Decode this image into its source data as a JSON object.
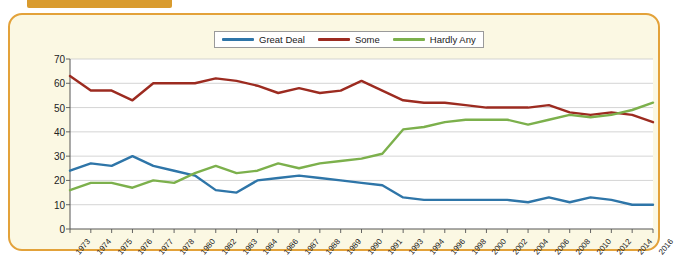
{
  "header": {
    "tab_label": "",
    "caption": ""
  },
  "panel": {
    "background_color": "#fbf8e3",
    "border_color": "#e3a23a"
  },
  "chart_data": {
    "type": "line",
    "title": "",
    "xlabel": "",
    "ylabel": "Percent",
    "ylim": [
      0,
      70
    ],
    "yticks": [
      0,
      10,
      20,
      30,
      40,
      50,
      60,
      70
    ],
    "grid": true,
    "legend_position": "top-center",
    "plot_background": "#ffffff",
    "categories": [
      "1973",
      "1974",
      "1975",
      "1976",
      "1977",
      "1978",
      "1980",
      "1982",
      "1983",
      "1984",
      "1986",
      "1987",
      "1988",
      "1989",
      "1990",
      "1991",
      "1993",
      "1994",
      "1996",
      "1998",
      "2000",
      "2002",
      "2004",
      "2006",
      "2008",
      "2010",
      "2012",
      "2014",
      "2016"
    ],
    "series": [
      {
        "name": "Great Deal",
        "color": "#2e75a8",
        "values": [
          24,
          27,
          26,
          30,
          26,
          24,
          22,
          16,
          15,
          20,
          21,
          22,
          21,
          20,
          19,
          18,
          13,
          12,
          12,
          12,
          12,
          12,
          11,
          13,
          11,
          13,
          12,
          10,
          10
        ]
      },
      {
        "name": "Some",
        "color": "#9c2b20",
        "values": [
          63,
          57,
          57,
          53,
          60,
          60,
          60,
          62,
          61,
          59,
          56,
          58,
          56,
          57,
          61,
          57,
          53,
          52,
          52,
          51,
          50,
          50,
          50,
          51,
          48,
          47,
          48,
          47,
          44
        ]
      },
      {
        "name": "Hardly Any",
        "color": "#7cb04c",
        "values": [
          16,
          19,
          19,
          17,
          20,
          19,
          23,
          26,
          23,
          24,
          27,
          25,
          27,
          28,
          29,
          31,
          41,
          42,
          44,
          45,
          45,
          45,
          43,
          45,
          47,
          46,
          47,
          49,
          52
        ]
      }
    ]
  },
  "legend": {
    "items": [
      {
        "label": "Great Deal",
        "color": "#2e75a8"
      },
      {
        "label": "Some",
        "color": "#9c2b20"
      },
      {
        "label": "Hardly Any",
        "color": "#7cb04c"
      }
    ]
  }
}
